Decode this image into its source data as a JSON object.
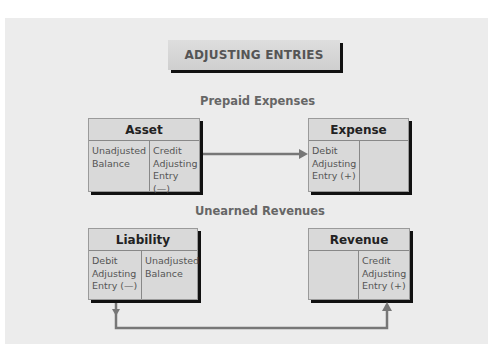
{
  "title": "ADJUSTING ENTRIES",
  "sections": {
    "prepaid": {
      "label": "Prepaid Expenses",
      "asset": {
        "title": "Asset",
        "left": "Unadjusted\nBalance",
        "right": "Credit\nAdjusting\nEntry (—)"
      },
      "expense": {
        "title": "Expense",
        "left": "Debit\nAdjusting\nEntry (+)",
        "right": ""
      }
    },
    "unearned": {
      "label": "Unearned Revenues",
      "liability": {
        "title": "Liability",
        "left": "Debit\nAdjusting\nEntry (—)",
        "right": "Unadjusted\nBalance"
      },
      "revenue": {
        "title": "Revenue",
        "left": "",
        "right": "Credit\nAdjusting\nEntry (+)"
      }
    }
  },
  "colors": {
    "panel": "#ececec",
    "box": "#d9d9d9",
    "shadow": "#111111",
    "arrow": "#777777"
  }
}
